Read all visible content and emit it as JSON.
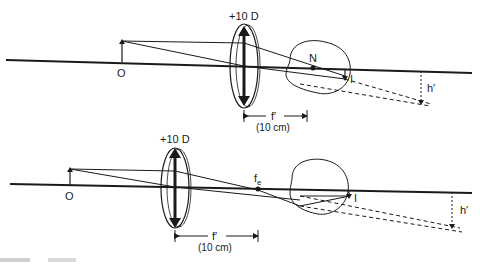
{
  "figure": {
    "top": {
      "lens_power": "+10 D",
      "object_label": "O",
      "node_label": "N",
      "image_label": "I",
      "image_height_label": "h′",
      "focal_label": "f′",
      "focal_value": "(10 cm)"
    },
    "bottom": {
      "lens_power": "+10 D",
      "object_label": "O",
      "focus_label": "f",
      "focus_subscript": "e",
      "image_label": "I",
      "image_height_label": "h′",
      "focal_label": "f′",
      "focal_value": "(10 cm)"
    },
    "caption_fragment": ""
  },
  "colors": {
    "ink": "#1a1a1a",
    "background": "#ffffff"
  }
}
